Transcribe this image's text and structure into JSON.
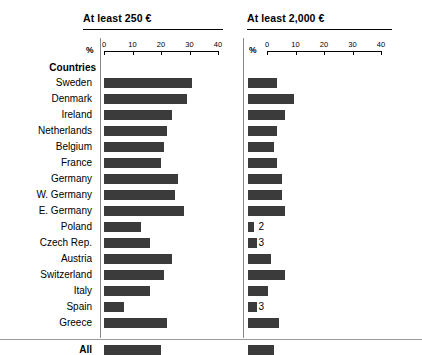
{
  "panels": [
    {
      "title": "At least 250 €"
    },
    {
      "title": "At least 2,000 €"
    }
  ],
  "axis": {
    "unit_label": "%",
    "ticks": [
      "0",
      "10",
      "20",
      "30",
      "40"
    ],
    "min": 0,
    "max": 40
  },
  "section_label": "Countries",
  "total_label": "All",
  "colors": {
    "bar": "#3b3b3b",
    "rule": "#000000",
    "separator": "#8a8a8a"
  },
  "chart_data": {
    "type": "bar",
    "title": "",
    "xlabel": "%",
    "ylabel": "Countries",
    "xlim": [
      0,
      40
    ],
    "grid": false,
    "legend": "none",
    "orientation": "horizontal",
    "categories": [
      "Sweden",
      "Denmark",
      "Ireland",
      "Netherlands",
      "Belgium",
      "France",
      "Germany",
      "W. Germany",
      "E. Germany",
      "Poland",
      "Czech Rep.",
      "Austria",
      "Switzerland",
      "Italy",
      "Spain",
      "Greece"
    ],
    "series": [
      {
        "name": "At least 250 €",
        "values": [
          31,
          29,
          24,
          22,
          21,
          20,
          26,
          25,
          28,
          13,
          16,
          24,
          21,
          16,
          7,
          22
        ],
        "total_label": "All",
        "total": 20
      },
      {
        "name": "At least 2,000 €",
        "values": [
          10,
          16,
          13,
          10,
          9,
          10,
          12,
          12,
          13,
          2,
          3,
          8,
          13,
          7,
          3,
          11
        ],
        "total_label": "All",
        "total": 9
      }
    ]
  },
  "rows": [
    {
      "label": "Sweden",
      "a": "31",
      "b": "10"
    },
    {
      "label": "Denmark",
      "a": "29",
      "b": "16"
    },
    {
      "label": "Ireland",
      "a": "24",
      "b": "13"
    },
    {
      "label": "Netherlands",
      "a": "22",
      "b": "10"
    },
    {
      "label": "Belgium",
      "a": "21",
      "b": "9"
    },
    {
      "label": "France",
      "a": "20",
      "b": "10"
    },
    {
      "label": "Germany",
      "a": "26",
      "b": "12"
    },
    {
      "label": "W. Germany",
      "a": "25",
      "b": "12"
    },
    {
      "label": "E. Germany",
      "a": "28",
      "b": "13"
    },
    {
      "label": "Poland",
      "a": "13",
      "b": "2"
    },
    {
      "label": "Czech Rep.",
      "a": "16",
      "b": "3"
    },
    {
      "label": "Austria",
      "a": "24",
      "b": "8"
    },
    {
      "label": "Switzerland",
      "a": "21",
      "b": "13"
    },
    {
      "label": "Italy",
      "a": "16",
      "b": "7"
    },
    {
      "label": "Spain",
      "a": "7",
      "b": "3"
    },
    {
      "label": "Greece",
      "a": "22",
      "b": "11"
    }
  ],
  "total_row": {
    "label": "All",
    "a": "20",
    "b": "9"
  }
}
